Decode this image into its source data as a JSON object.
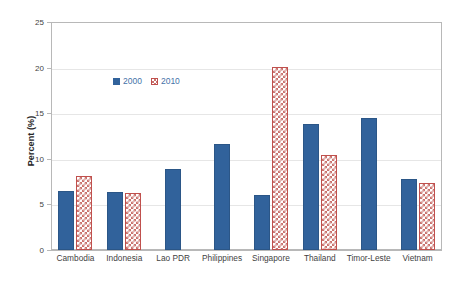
{
  "chart_data": {
    "type": "bar",
    "title": "",
    "xlabel": "",
    "ylabel": "Percent (%)",
    "ylim": [
      0,
      25
    ],
    "yticks": [
      0,
      5,
      10,
      15,
      20,
      25
    ],
    "ytick_labels": [
      "0",
      "5",
      "10",
      "15",
      "20",
      "25"
    ],
    "grid": true,
    "legend_position": "upper-left-inside",
    "categories": [
      "Cambodia",
      "Indonesia",
      "Lao PDR",
      "Philippines",
      "Singapore",
      "Thailand",
      "Timor-Leste",
      "Vietnam"
    ],
    "series": [
      {
        "name": "2000",
        "color": "#31629B",
        "values": [
          6.5,
          6.4,
          8.9,
          11.6,
          6.0,
          13.8,
          14.5,
          7.8
        ]
      },
      {
        "name": "2010",
        "color": "#C0504D",
        "values": [
          8.1,
          6.2,
          null,
          null,
          20.1,
          10.4,
          null,
          7.4
        ]
      }
    ]
  },
  "legend": {
    "items": [
      {
        "label": "2000",
        "swatch": "solid-blue-swatch"
      },
      {
        "label": "2010",
        "swatch": "hatched-red-swatch"
      }
    ]
  },
  "colors": {
    "series_2000": "#31629B",
    "series_2010": "#C0504D",
    "grid": "#e6e6e6",
    "frame": "#b8b8b8",
    "text": "#3f3f3f",
    "legend_text": "#4472a8",
    "background": "#ffffff"
  }
}
